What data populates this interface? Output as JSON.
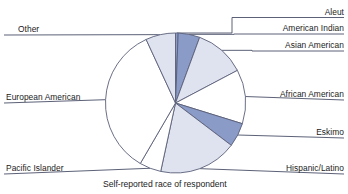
{
  "caption": "Self-reported race of respondent",
  "colors": {
    "slice_light": "#dfe3f0",
    "slice_medium": "#8a9bc8",
    "slice_white": "#ffffff",
    "outline": "#5a5f78",
    "leader_line": "#4a4f68",
    "text": "#1b1b22",
    "background": "#ffffff"
  },
  "chart_data": {
    "type": "pie",
    "title": "",
    "xlabel": "Self-reported race of respondent",
    "ylabel": "",
    "legend_position": "leader-labels",
    "grid": false,
    "start_angle_deg": 0,
    "direction": "clockwise",
    "categories": [
      "Aleut",
      "American Indian",
      "Asian American",
      "African American",
      "Eskimo",
      "Hispanic/Latino",
      "Pacific Islander",
      "European American",
      "Other"
    ],
    "values": [
      0.6,
      5.0,
      11.7,
      12.5,
      5.6,
      18.1,
      5.0,
      34.7,
      6.8
    ],
    "value_unit": "percent",
    "slices": [
      {
        "label": "Aleut",
        "value": 0.6,
        "angle_deg": 2.2,
        "fill": "#8a9bc8",
        "label_side": "right"
      },
      {
        "label": "American Indian",
        "value": 5.0,
        "angle_deg": 18.0,
        "fill": "#8a9bc8",
        "label_side": "right"
      },
      {
        "label": "Asian American",
        "value": 11.7,
        "angle_deg": 42.0,
        "fill": "#dfe3f0",
        "label_side": "right"
      },
      {
        "label": "African American",
        "value": 12.5,
        "angle_deg": 45.0,
        "fill": "#ffffff",
        "label_side": "right"
      },
      {
        "label": "Eskimo",
        "value": 5.6,
        "angle_deg": 20.0,
        "fill": "#8a9bc8",
        "label_side": "right"
      },
      {
        "label": "Hispanic/Latino",
        "value": 18.1,
        "angle_deg": 65.0,
        "fill": "#dfe3f0",
        "label_side": "right"
      },
      {
        "label": "Pacific Islander",
        "value": 5.0,
        "angle_deg": 18.0,
        "fill": "#ffffff",
        "label_side": "left"
      },
      {
        "label": "European American",
        "value": 34.7,
        "angle_deg": 125.0,
        "fill": "#ffffff",
        "label_side": "left"
      },
      {
        "label": "Other",
        "value": 6.8,
        "angle_deg": 24.8,
        "fill": "#dfe3f0",
        "label_side": "left"
      }
    ]
  },
  "labels": {
    "aleut": "Aleut",
    "american_indian": "American Indian",
    "asian_american": "Asian American",
    "african_american": "African American",
    "eskimo": "Eskimo",
    "hispanic_latino": "Hispanic/Latino",
    "pacific_islander": "Pacific Islander",
    "european_american": "European American",
    "other": "Other"
  }
}
